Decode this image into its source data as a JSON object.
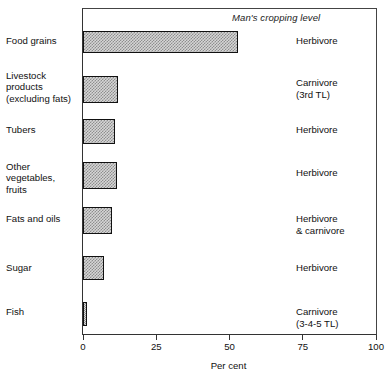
{
  "chart_data": {
    "type": "bar",
    "orientation": "horizontal",
    "title": "",
    "subtitle": "",
    "xlabel": "Per cent",
    "ylabel": "",
    "xlim": [
      0,
      100
    ],
    "xticks": [
      0,
      25,
      50,
      75,
      100
    ],
    "xtick_labels": [
      "0",
      "25",
      "50",
      "75",
      "100"
    ],
    "grid": false,
    "legend": null,
    "header_note": "Man's cropping level",
    "categories": [
      "Food grains",
      "Livestock products (excluding fats)",
      "Tubers",
      "Other vegetables, fruits",
      "Fats and oils",
      "Sugar",
      "Fish"
    ],
    "values": [
      53,
      12,
      11,
      11.5,
      10,
      7,
      1.5
    ],
    "annotations": [
      "Herbivore",
      "Carnivore (3rd TL)",
      "Herbivore",
      "Herbivore",
      "Herbivore & carnivore",
      "Herbivore",
      "Carnivore (3-4-5 TL)"
    ]
  },
  "rows": [
    {
      "label_lines": [
        "Food grains"
      ],
      "value": 53,
      "trophic_lines": [
        "Herbivore"
      ]
    },
    {
      "label_lines": [
        "Livestock",
        "products",
        "(excluding fats)"
      ],
      "value": 12,
      "trophic_lines": [
        "Carnivore",
        "(3rd TL)"
      ]
    },
    {
      "label_lines": [
        "Tubers"
      ],
      "value": 11,
      "trophic_lines": [
        "Herbivore"
      ]
    },
    {
      "label_lines": [
        "Other",
        "vegetables,",
        "fruits"
      ],
      "value": 11.5,
      "trophic_lines": [
        "Herbivore"
      ]
    },
    {
      "label_lines": [
        "Fats and oils"
      ],
      "value": 10,
      "trophic_lines": [
        "Herbivore",
        "& carnivore"
      ]
    },
    {
      "label_lines": [
        "Sugar"
      ],
      "value": 7,
      "trophic_lines": [
        "Herbivore"
      ]
    },
    {
      "label_lines": [
        "Fish"
      ],
      "value": 1.5,
      "trophic_lines": [
        "Carnivore",
        "(3-4-5 TL)"
      ]
    }
  ],
  "axis": {
    "title": "Per cent",
    "ticks": [
      {
        "value": 0,
        "label": "0"
      },
      {
        "value": 25,
        "label": "25"
      },
      {
        "value": 50,
        "label": "50"
      },
      {
        "value": 75,
        "label": "75"
      },
      {
        "value": 100,
        "label": "100"
      }
    ]
  },
  "colors": {
    "bar_border": "#111111",
    "bar_fill_light": "#d6d6d6",
    "bar_fill_dot": "#8e8e8e",
    "frame": "#333333",
    "text": "#111111",
    "background": "#ffffff"
  },
  "header": {
    "cropping_level_note": "Man's cropping level"
  }
}
